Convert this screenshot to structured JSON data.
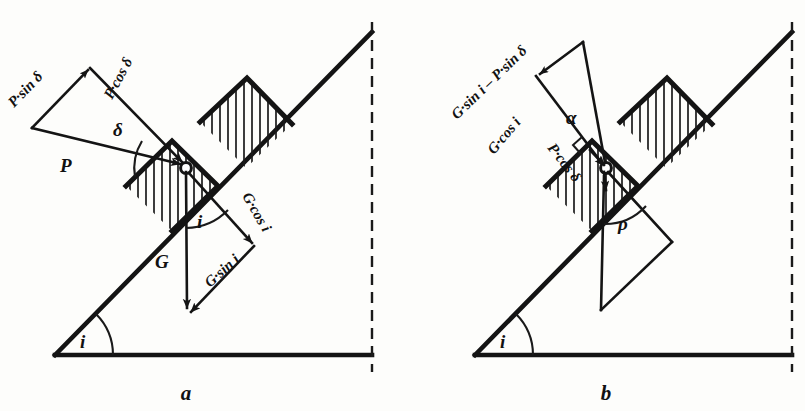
{
  "figure": {
    "title_a": "a",
    "title_b": "b",
    "background_color": "#fdfdfb",
    "ink_color": "#141414"
  },
  "panel_a": {
    "caption": "a",
    "labels": {
      "p_sin_delta": "P·sin δ",
      "p_cos_delta": "P·cos δ",
      "delta": "δ",
      "p": "P",
      "g": "G",
      "g_cos_i": "G·cos i",
      "g_sin_i": "G·sin i",
      "angle_i_top": "i",
      "angle_i_base": "i"
    }
  },
  "panel_b": {
    "caption": "b",
    "labels": {
      "g_sin_i_minus_p_sin_delta": "G·sin i – P·sin δ",
      "g_cos_i": "G·cos i",
      "p_cos_delta": "P·cos δ",
      "alpha": "α",
      "rho": "ρ",
      "angle_i_base": "i"
    }
  }
}
